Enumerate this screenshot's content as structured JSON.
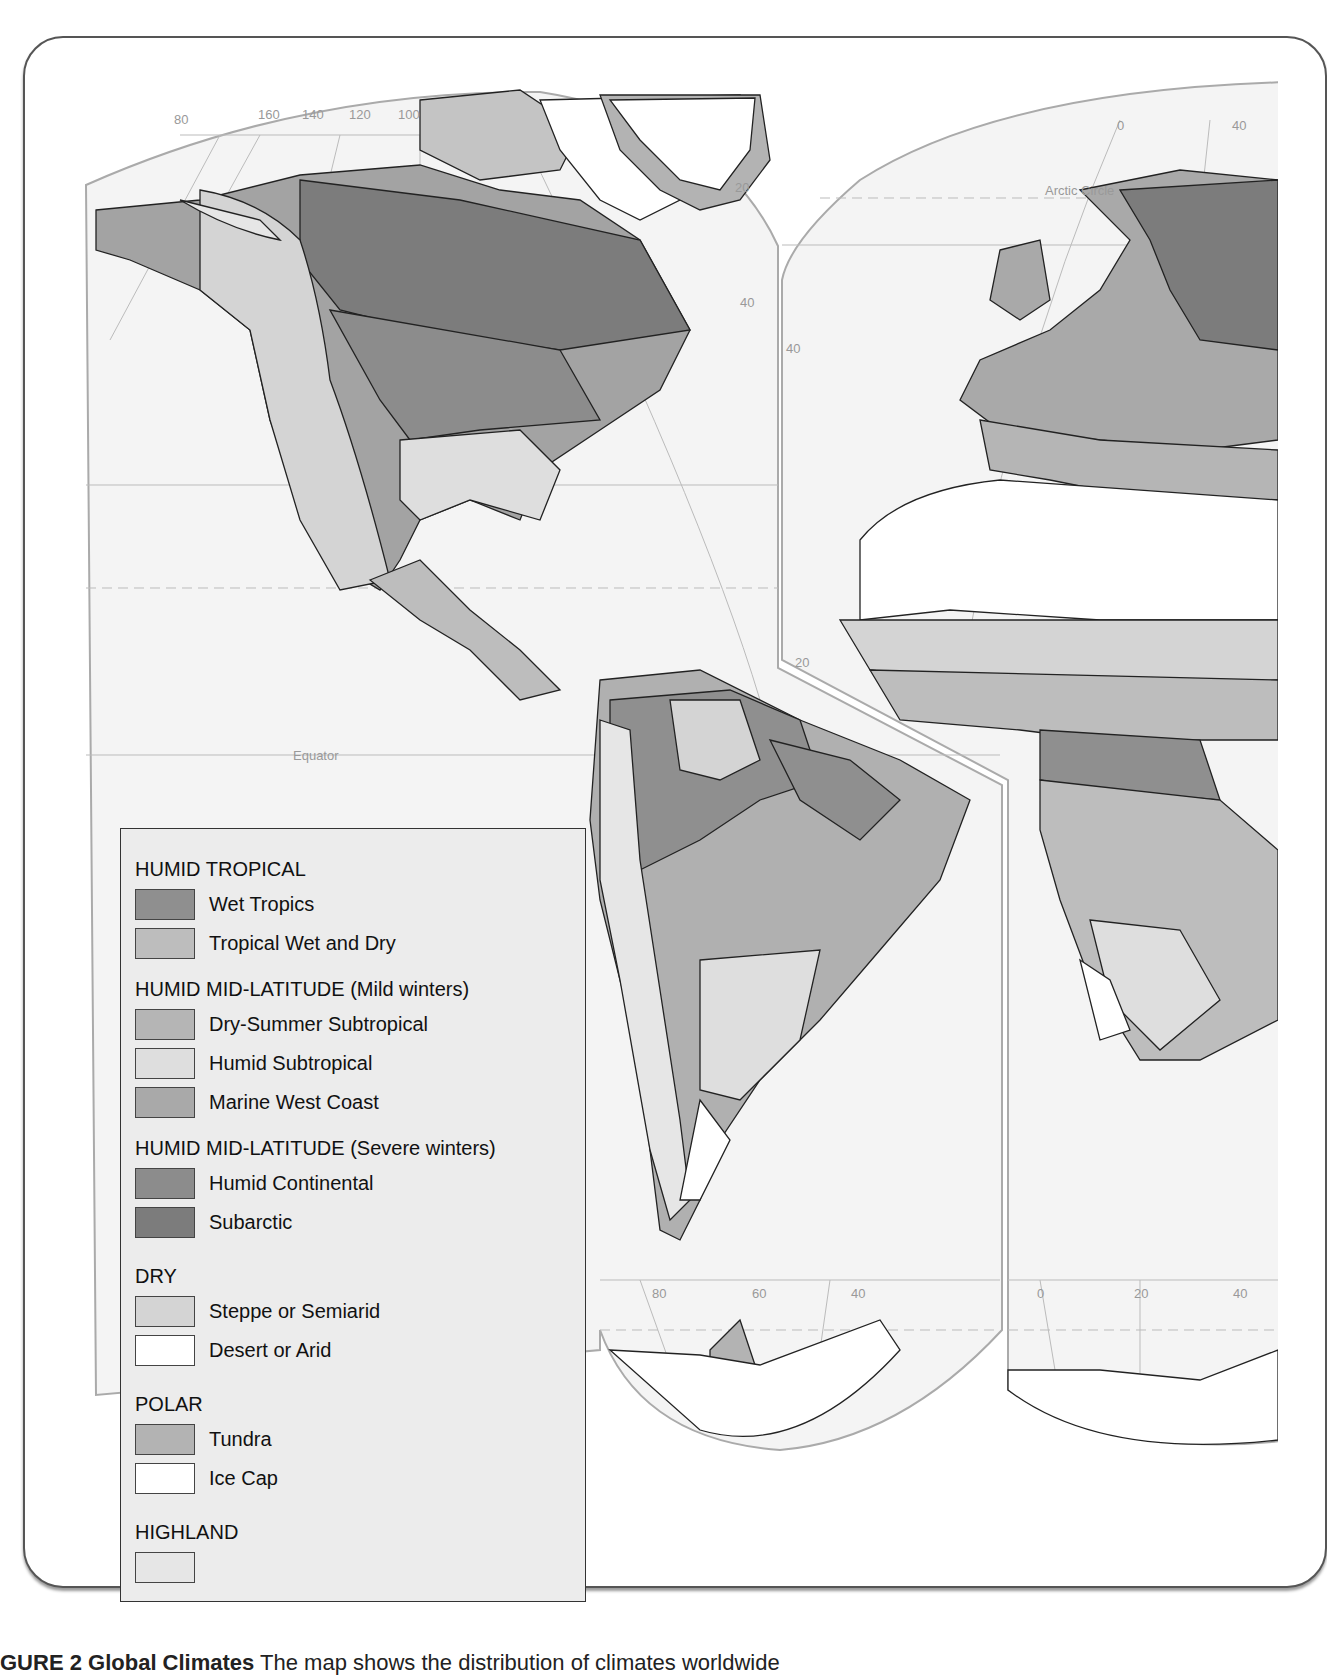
{
  "figure": {
    "caption_prefix": "GURE 2",
    "caption_title": "Global Climates",
    "caption_text": "The map shows the distribution of climates worldwide"
  },
  "map": {
    "labels": {
      "lon_top_left": [
        "80",
        "160",
        "140",
        "120",
        "100"
      ],
      "lat_left_20": "20",
      "lat_left_40": "40",
      "lat_right_40": "40",
      "lon_top_right_0": "0",
      "lon_top_right_40": "40",
      "arctic_circle": "Arctic Circle",
      "equator": "Equator",
      "lat_right_20": "20",
      "lon_bottom_sa": [
        "80",
        "60",
        "40"
      ],
      "lon_bottom_af": [
        "0",
        "20",
        "40"
      ]
    },
    "colors": {
      "wet_tropics": "#8f8f8f",
      "tropical_wet_dry": "#bdbdbd",
      "dry_summer_subtropical": "#b5b5b5",
      "humid_subtropical": "#dedede",
      "marine_west_coast": "#a9a9a9",
      "humid_continental": "#8c8c8c",
      "subarctic": "#7c7c7c",
      "steppe": "#d4d4d4",
      "desert": "#ffffff",
      "tundra": "#b3b3b3",
      "ice_cap": "#ffffff",
      "highland": "#e6e6e6",
      "ocean": "#f4f4f4"
    }
  },
  "legend": {
    "groups": [
      {
        "title": "HUMID TROPICAL",
        "items": [
          {
            "label": "Wet Tropics",
            "color": "#8f8f8f"
          },
          {
            "label": "Tropical Wet and Dry",
            "color": "#bdbdbd"
          }
        ]
      },
      {
        "title": "HUMID MID-LATITUDE (Mild winters)",
        "items": [
          {
            "label": "Dry-Summer Subtropical",
            "color": "#b5b5b5"
          },
          {
            "label": "Humid Subtropical",
            "color": "#dedede"
          },
          {
            "label": "Marine West Coast",
            "color": "#a9a9a9"
          }
        ]
      },
      {
        "title": "HUMID MID-LATITUDE (Severe winters)",
        "items": [
          {
            "label": "Humid Continental",
            "color": "#8c8c8c"
          },
          {
            "label": "Subarctic",
            "color": "#7c7c7c"
          }
        ]
      },
      {
        "title": "DRY",
        "items": [
          {
            "label": "Steppe or Semiarid",
            "color": "#d4d4d4"
          },
          {
            "label": "Desert or Arid",
            "color": "#ffffff"
          }
        ]
      },
      {
        "title": "POLAR",
        "items": [
          {
            "label": "Tundra",
            "color": "#b3b3b3"
          },
          {
            "label": "Ice Cap",
            "color": "#ffffff"
          }
        ]
      },
      {
        "title": "HIGHLAND",
        "items": [
          {
            "label": "",
            "color": "#e6e6e6"
          }
        ]
      }
    ]
  }
}
